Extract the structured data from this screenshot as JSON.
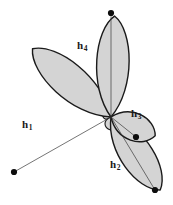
{
  "figure": {
    "kind": "sp3-hybrid-orbital-diagram",
    "background_color": "#ffffff",
    "canvas": {
      "width": 173,
      "height": 205
    },
    "center": {
      "x": 111,
      "y": 117
    },
    "style": {
      "lobe_fill": "#d4d4d4",
      "lobe_stroke": "#1a1a1a",
      "lobe_stroke_width": 1.4,
      "axis_line_color": "#3a3a3a",
      "axis_line_width": 0.7,
      "dot_color": "#0d0d0d",
      "dot_radius": 3.1,
      "backlobe_fill": "#d4d4d4"
    },
    "orbitals": [
      {
        "id": "h1",
        "label": "h",
        "subscript": "1",
        "direction": "lower-left",
        "angle_deg": 221,
        "length": 104,
        "half_width": 20,
        "back_lobe_length": 12,
        "label_position": {
          "x": 22,
          "y": 119
        },
        "tip_dot": {
          "x": 14,
          "y": 172
        },
        "dot_inside_lobe": false,
        "axis_end": {
          "x": 14,
          "y": 172
        }
      },
      {
        "id": "h2",
        "label": "h",
        "subscript": "2",
        "direction": "lower-right",
        "angle_deg": 56,
        "length": 88,
        "half_width": 19,
        "back_lobe_length": 11,
        "label_position": {
          "x": 110,
          "y": 159
        },
        "tip_dot": {
          "x": 155,
          "y": 190
        },
        "dot_inside_lobe": false,
        "axis_end": {
          "x": 155,
          "y": 190
        }
      },
      {
        "id": "h3",
        "label": "h",
        "subscript": "3",
        "direction": "right",
        "angle_deg": 23,
        "length": 48,
        "half_width": 16,
        "back_lobe_length": 9,
        "label_position": {
          "x": 131,
          "y": 108
        },
        "tip_dot": {
          "x": 136,
          "y": 137
        },
        "dot_inside_lobe": true,
        "axis_end": {
          "x": 136,
          "y": 137
        }
      },
      {
        "id": "h4",
        "label": "h",
        "subscript": "4",
        "direction": "up",
        "angle_deg": 272,
        "length": 101,
        "half_width": 19,
        "back_lobe_length": 13,
        "label_position": {
          "x": 77,
          "y": 40
        },
        "tip_dot": {
          "x": 111,
          "y": 13
        },
        "dot_inside_lobe": false,
        "axis_end": {
          "x": 111,
          "y": 13
        }
      }
    ]
  }
}
